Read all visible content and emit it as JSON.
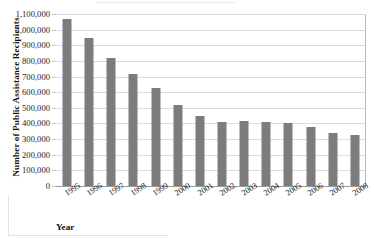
{
  "chart_data": {
    "type": "bar",
    "title": "",
    "xlabel": "Year",
    "ylabel": "Number of Public Assistance Recipients",
    "categories": [
      "1995",
      "1996",
      "1997",
      "1998",
      "1999",
      "2000",
      "2001",
      "2002",
      "2003",
      "2004",
      "2005",
      "2006",
      "2007",
      "2008"
    ],
    "values": [
      1070000,
      945000,
      820000,
      715000,
      625000,
      520000,
      450000,
      410000,
      415000,
      412000,
      400000,
      375000,
      340000,
      325000
    ],
    "ylim": [
      0,
      1100000
    ],
    "ytick_values": [
      0,
      100000,
      200000,
      300000,
      400000,
      500000,
      600000,
      700000,
      800000,
      900000,
      1000000,
      1100000
    ],
    "ytick_labels": [
      "0",
      "100,000",
      "200,000",
      "300,000",
      "400,000",
      "500,000",
      "600,000",
      "700,000",
      "800,000",
      "900,000",
      "1,000,000",
      "1,100,000"
    ],
    "grid": true,
    "legend": "none",
    "series_color": "#7c7c7c",
    "gridline_color": "#dcdcdc",
    "axis_color": "#9a9a9a"
  }
}
